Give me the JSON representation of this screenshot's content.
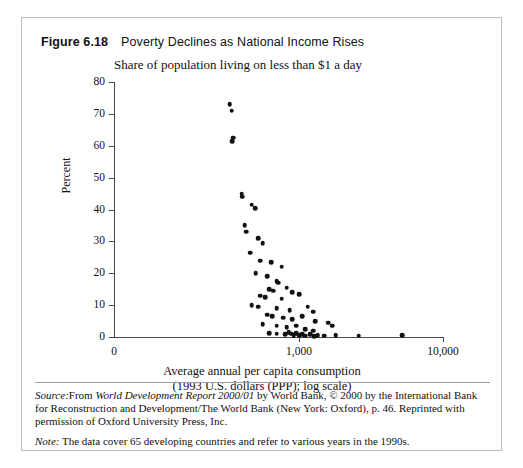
{
  "figure": {
    "number": "Figure 6.18",
    "title": "Poverty Declines as National Income Rises",
    "subtitle": "Share of population living on less than $1 a day",
    "source_label": "Source:",
    "source_text_1": "From ",
    "source_italic_1": "World Development Report 2000/01",
    "source_text_2": " by World Bank, © 2000 by the International Bank for Reconstruction and Development/The World Bank (New York: Oxford), p. 46. Reprinted with permission of Oxford University Press, Inc.",
    "note_label": "Note:",
    "note_text": " The data cover 65 developing countries and refer to various years in the 1990s."
  },
  "chart_data": {
    "type": "scatter",
    "title": "Poverty Declines as National Income Rises",
    "subtitle": "Share of population living on less than $1 a day",
    "xlabel": "Average annual per capita consumption",
    "xlabel_line2": "(1993 U.S. dollars (PPP); log scale)",
    "ylabel": "Percent",
    "x_scale": "log",
    "y_scale": "linear",
    "ylim": [
      0,
      80
    ],
    "yticks": [
      0,
      10,
      20,
      30,
      40,
      50,
      60,
      70,
      80
    ],
    "xticks": [
      0,
      1000,
      10000
    ],
    "xtick_labels": [
      "0",
      "1,000",
      "10,000"
    ],
    "grid": false,
    "legend": false,
    "marker_color": "#111111",
    "n_points": 65,
    "points": [
      [
        330,
        73.0
      ],
      [
        340,
        71.0
      ],
      [
        345,
        61.5
      ],
      [
        350,
        62.5
      ],
      [
        400,
        45.0
      ],
      [
        405,
        44.0
      ],
      [
        470,
        41.5
      ],
      [
        495,
        40.5
      ],
      [
        420,
        35.0
      ],
      [
        430,
        33.0
      ],
      [
        520,
        31.0
      ],
      [
        560,
        29.5
      ],
      [
        460,
        26.5
      ],
      [
        540,
        24.0
      ],
      [
        640,
        23.5
      ],
      [
        760,
        22.0
      ],
      [
        500,
        20.0
      ],
      [
        600,
        19.0
      ],
      [
        700,
        17.5
      ],
      [
        720,
        17.0
      ],
      [
        620,
        15.0
      ],
      [
        660,
        14.5
      ],
      [
        820,
        15.5
      ],
      [
        900,
        14.0
      ],
      [
        540,
        13.0
      ],
      [
        580,
        12.5
      ],
      [
        760,
        12.0
      ],
      [
        1000,
        13.5
      ],
      [
        470,
        10.0
      ],
      [
        520,
        9.5
      ],
      [
        700,
        9.0
      ],
      [
        860,
        8.5
      ],
      [
        1150,
        9.5
      ],
      [
        1250,
        8.0
      ],
      [
        600,
        7.0
      ],
      [
        650,
        6.5
      ],
      [
        780,
        6.0
      ],
      [
        900,
        5.5
      ],
      [
        1050,
        6.5
      ],
      [
        1300,
        5.0
      ],
      [
        560,
        4.0
      ],
      [
        700,
        3.5
      ],
      [
        820,
        3.0
      ],
      [
        960,
        3.5
      ],
      [
        1100,
        2.5
      ],
      [
        1250,
        2.0
      ],
      [
        1600,
        4.5
      ],
      [
        1700,
        3.5
      ],
      [
        620,
        1.2
      ],
      [
        700,
        1.0
      ],
      [
        800,
        0.8
      ],
      [
        850,
        1.5
      ],
      [
        880,
        1.0
      ],
      [
        920,
        0.6
      ],
      [
        960,
        1.2
      ],
      [
        1000,
        0.5
      ],
      [
        1050,
        0.9
      ],
      [
        1100,
        0.4
      ],
      [
        1200,
        0.8
      ],
      [
        1280,
        0.3
      ],
      [
        1350,
        0.6
      ],
      [
        1500,
        0.4
      ],
      [
        1800,
        0.5
      ],
      [
        2600,
        0.4
      ],
      [
        5200,
        0.5
      ]
    ]
  }
}
